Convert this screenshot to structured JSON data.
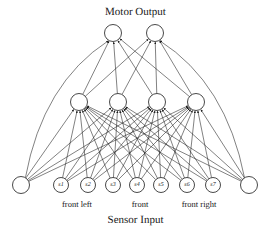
{
  "figure": {
    "title_top": "Motor Output",
    "title_bottom": "Sensor Input",
    "width": 271,
    "height": 233,
    "background": "#ffffff",
    "stroke_color": "#1a1a1a"
  },
  "layers": {
    "output": {
      "name": "Motor Output",
      "node_count": 2,
      "radius": 8.5,
      "y": 33,
      "nodes": [
        {
          "id": "m1",
          "label": "",
          "cx": 113,
          "cy": 33
        },
        {
          "id": "m2",
          "label": "",
          "cx": 155,
          "cy": 33
        }
      ]
    },
    "hidden": {
      "name": "Hidden",
      "node_count": 4,
      "radius": 8.5,
      "y": 102,
      "nodes": [
        {
          "id": "h1",
          "label": "",
          "cx": 79,
          "cy": 102
        },
        {
          "id": "h2",
          "label": "",
          "cx": 118,
          "cy": 102
        },
        {
          "id": "h3",
          "label": "",
          "cx": 157,
          "cy": 102
        },
        {
          "id": "h4",
          "label": "",
          "cx": 196,
          "cy": 102
        }
      ]
    },
    "input": {
      "name": "Sensor Input",
      "node_count": 9,
      "sensor_radius": 7.5,
      "bias_radius": 8.5,
      "y": 185,
      "nodes": [
        {
          "id": "left-bias",
          "label": "",
          "cx": 21,
          "cy": 185,
          "type": "bias"
        },
        {
          "id": "s1",
          "label": "s1",
          "cx": 61,
          "cy": 185,
          "type": "sensor"
        },
        {
          "id": "s2",
          "label": "s2",
          "cx": 88,
          "cy": 185,
          "type": "sensor"
        },
        {
          "id": "s3",
          "label": "s3",
          "cx": 113,
          "cy": 185,
          "type": "sensor"
        },
        {
          "id": "s4",
          "label": "s4",
          "cx": 137,
          "cy": 185,
          "type": "sensor"
        },
        {
          "id": "s5",
          "label": "s5",
          "cx": 161,
          "cy": 185,
          "type": "sensor"
        },
        {
          "id": "s6",
          "label": "s6",
          "cx": 187,
          "cy": 185,
          "type": "sensor"
        },
        {
          "id": "s7",
          "label": "s7",
          "cx": 213,
          "cy": 185,
          "type": "sensor"
        },
        {
          "id": "right-bias",
          "label": "",
          "cx": 249,
          "cy": 185,
          "type": "bias"
        }
      ]
    }
  },
  "group_labels": [
    {
      "id": "front-left",
      "text": "front left",
      "x": 77,
      "y": 200
    },
    {
      "id": "front",
      "text": "front",
      "x": 140,
      "y": 200
    },
    {
      "id": "front-right",
      "text": "front right",
      "x": 199,
      "y": 200
    }
  ]
}
